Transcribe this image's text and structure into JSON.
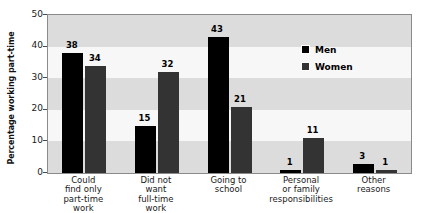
{
  "chart_data": {
    "type": "bar",
    "title": "",
    "subtitle": "",
    "xlabel": "",
    "ylabel": "Percentage working part-time",
    "ylim": [
      0,
      50
    ],
    "yticks": [
      0,
      10,
      20,
      30,
      40,
      50
    ],
    "ytick_labels": [
      "0",
      "10",
      "20",
      "30",
      "40",
      "50"
    ],
    "grid": false,
    "banded_background": true,
    "legend_position": "inside-upper-right",
    "categories": [
      "Could find only part-time work",
      "Did not want full-time work",
      "Going to school",
      "Personal or family responsibilities",
      "Other reasons"
    ],
    "category_lines": [
      [
        "Could",
        "find only",
        "part-time",
        "work"
      ],
      [
        "Did not",
        "want",
        "full-time",
        "work"
      ],
      [
        "Going to",
        "school"
      ],
      [
        "Personal",
        "or family",
        "responsibilities"
      ],
      [
        "Other",
        "reasons"
      ]
    ],
    "series": [
      {
        "name": "Men",
        "color": "#000000",
        "values": [
          38,
          15,
          43,
          1,
          3
        ]
      },
      {
        "name": "Women",
        "color": "#333333",
        "values": [
          34,
          32,
          21,
          11,
          1
        ]
      }
    ],
    "data_labels": [
      "38",
      "34",
      "15",
      "32",
      "43",
      "21",
      "1",
      "11",
      "3",
      "1"
    ]
  },
  "legend": {
    "items": [
      {
        "label": "Men",
        "swatch": "men-swatch"
      },
      {
        "label": "Women",
        "swatch": "women-swatch"
      }
    ]
  },
  "colors": {
    "men": "#000000",
    "women": "#333333",
    "plot_band_dark": "#dcdcdc",
    "plot_band_light": "#f7f7f7",
    "plot_border": "#8a8a8a",
    "text": "#1a1a1a",
    "background": "#ffffff"
  }
}
